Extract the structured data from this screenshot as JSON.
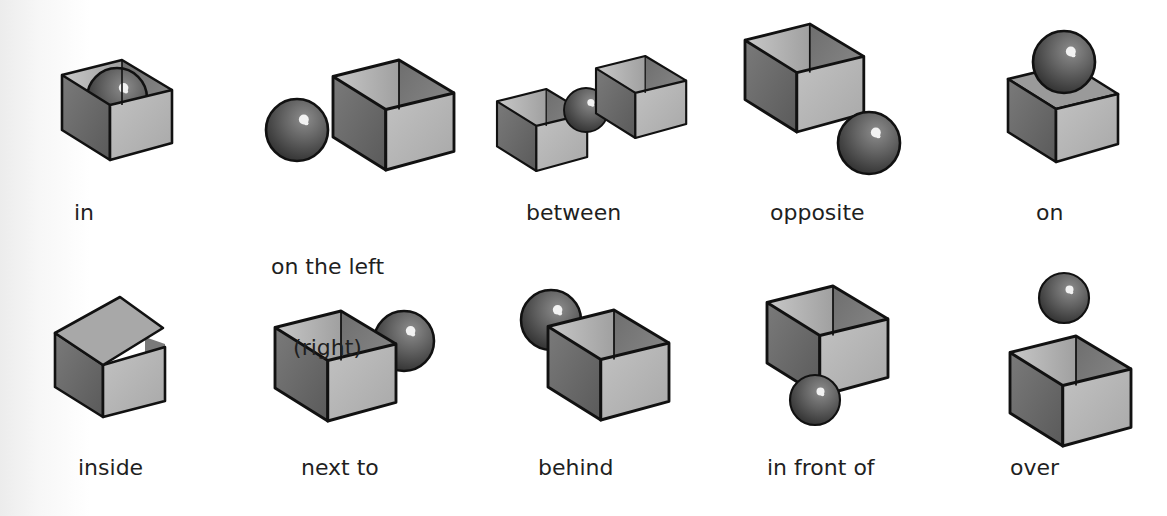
{
  "figure": {
    "type": "preposition-illustrations",
    "rows": [
      {
        "items": [
          {
            "id": "in",
            "label": "in"
          },
          {
            "id": "on-the-left",
            "label": "on the left",
            "sublabel": "(right)"
          },
          {
            "id": "between",
            "label": "between"
          },
          {
            "id": "opposite",
            "label": "opposite"
          },
          {
            "id": "on",
            "label": "on"
          }
        ]
      },
      {
        "items": [
          {
            "id": "inside",
            "label": "inside"
          },
          {
            "id": "next-to",
            "label": "next to"
          },
          {
            "id": "behind",
            "label": "behind"
          },
          {
            "id": "in-front-of",
            "label": "in front of"
          },
          {
            "id": "over",
            "label": "over"
          }
        ]
      }
    ]
  },
  "colors": {
    "outline": "#111111",
    "box_left_face": "#6e6e6e",
    "box_right_face": "#b4b4b4",
    "box_inner_back": "#bdbdbd",
    "box_inner_side": "#8a8a8a",
    "lid": "#a9a9a9",
    "ball_dark": "#3c3c3c",
    "ball_mid": "#6a6a6a",
    "highlight": "#f4f4f4",
    "text": "#1f1f1f"
  }
}
